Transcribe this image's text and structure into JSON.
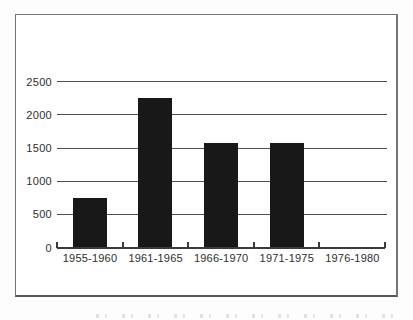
{
  "figure": {
    "background": "#ffffff",
    "border_color": "#757575"
  },
  "chart_data": {
    "type": "bar",
    "title": "",
    "xlabel": "",
    "ylabel": "",
    "categories": [
      "1955-1960",
      "1961-1965",
      "1966-1970",
      "1971-1975",
      "1976-1980"
    ],
    "values": [
      750,
      2250,
      1575,
      1575,
      0
    ],
    "y_ticks": [
      0,
      500,
      1000,
      1500,
      2000,
      2500
    ],
    "y_tick_labels": [
      "0",
      "500",
      "1000",
      "1500",
      "2000",
      "2500"
    ],
    "ylim": [
      0,
      2500
    ],
    "grid": "horizontal",
    "legend": "none",
    "bar_color": "#181818",
    "gridline_color": "#4f4f4f",
    "axis_color": "#3a3a3a",
    "label_color": "#2e2e2e"
  }
}
